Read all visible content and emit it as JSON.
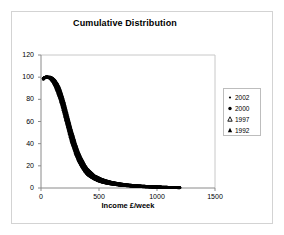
{
  "chart_data": {
    "type": "scatter",
    "title": "Cumulative Distribution",
    "xlabel": "Income £/week",
    "ylabel": "",
    "xlim": [
      0,
      1500
    ],
    "ylim": [
      0,
      120
    ],
    "xticks": [
      "0",
      "500",
      "1000",
      "1500"
    ],
    "xtick_values": [
      0,
      500,
      1000,
      1500
    ],
    "yticks": [
      "0",
      "20",
      "40",
      "60",
      "80",
      "100",
      "120"
    ],
    "ytick_values": [
      0,
      20,
      40,
      60,
      80,
      100,
      120
    ],
    "grid": false,
    "legend_position": "right",
    "legend": [
      "2002",
      "2000",
      "1997",
      "1992"
    ],
    "series": [
      {
        "name": "2002",
        "marker": "dot",
        "color": "#000000",
        "x": [
          20,
          40,
          60,
          80,
          100,
          120,
          140,
          160,
          180,
          200,
          220,
          240,
          260,
          280,
          300,
          320,
          340,
          360,
          380,
          400,
          430,
          460,
          490,
          520,
          560,
          600,
          640,
          680,
          720,
          760,
          800,
          850,
          900,
          950,
          1000,
          1060,
          1120,
          1180,
          1200
        ],
        "values": [
          99,
          100,
          100,
          100,
          99,
          97,
          94,
          90,
          84,
          77,
          69,
          61,
          53,
          46,
          39,
          33,
          28,
          24,
          20,
          17,
          14,
          11,
          9.5,
          8,
          6.5,
          5.4,
          4.5,
          3.8,
          3.2,
          2.7,
          2.3,
          1.9,
          1.6,
          1.3,
          1.1,
          0.8,
          0.6,
          0.4,
          0.3
        ]
      },
      {
        "name": "2000",
        "marker": "dot",
        "color": "#000000",
        "x": [
          20,
          40,
          60,
          80,
          100,
          120,
          140,
          160,
          180,
          200,
          220,
          240,
          260,
          280,
          300,
          320,
          340,
          360,
          380,
          400,
          430,
          460,
          490,
          520,
          560,
          600,
          640,
          680,
          720,
          760,
          800,
          850,
          900,
          950,
          1000,
          1060,
          1120,
          1180,
          1200
        ],
        "values": [
          99,
          100,
          100,
          99.5,
          98,
          96,
          93,
          88,
          82,
          75,
          67,
          59,
          51,
          44,
          37,
          31,
          26,
          22,
          18.5,
          15.5,
          12.5,
          10,
          8.5,
          7,
          5.7,
          4.7,
          3.9,
          3.3,
          2.8,
          2.3,
          2,
          1.6,
          1.3,
          1.1,
          0.9,
          0.6,
          0.4,
          0.3,
          0.2
        ]
      },
      {
        "name": "1997",
        "marker": "triangle",
        "color": "#000000",
        "x": [
          20,
          40,
          60,
          80,
          100,
          120,
          140,
          160,
          180,
          200,
          220,
          240,
          260,
          280,
          300,
          320,
          340,
          360,
          380,
          400,
          430,
          460,
          490,
          520,
          560,
          600,
          640,
          680,
          720,
          760,
          800,
          850,
          900,
          950,
          1000,
          1060,
          1120,
          1180,
          1200
        ],
        "values": [
          99,
          100,
          100,
          99,
          97,
          94,
          90,
          85,
          78,
          70,
          62,
          54,
          46,
          39,
          33,
          28,
          23,
          19.5,
          16,
          13.5,
          11,
          9,
          7.5,
          6,
          5,
          4,
          3.4,
          2.8,
          2.4,
          2,
          1.7,
          1.4,
          1.1,
          0.9,
          0.7,
          0.5,
          0.35,
          0.25,
          0.2
        ]
      },
      {
        "name": "1992",
        "marker": "triangle",
        "color": "#000000",
        "x": [
          20,
          40,
          60,
          80,
          100,
          120,
          140,
          160,
          180,
          200,
          220,
          240,
          260,
          280,
          300,
          320,
          340,
          360,
          380,
          400,
          430,
          460,
          490,
          520,
          560,
          600,
          640,
          680,
          720,
          760,
          800,
          850,
          900,
          950,
          1000,
          1060,
          1120,
          1180,
          1200
        ],
        "values": [
          98,
          100,
          100,
          98.5,
          96,
          92,
          87,
          81,
          74,
          66,
          58,
          50,
          42,
          36,
          30,
          25,
          21,
          17.5,
          14.5,
          12,
          9.8,
          8,
          6.5,
          5.4,
          4.4,
          3.6,
          3,
          2.5,
          2.1,
          1.8,
          1.5,
          1.2,
          1,
          0.8,
          0.6,
          0.45,
          0.3,
          0.2,
          0.15
        ]
      }
    ]
  },
  "legend": {
    "items": [
      {
        "label": "2002",
        "marker": "dot-small-icon"
      },
      {
        "label": "2000",
        "marker": "dot-icon"
      },
      {
        "label": "1997",
        "marker": "triangle-icon"
      },
      {
        "label": "1992",
        "marker": "triangle-filled-icon"
      }
    ]
  }
}
